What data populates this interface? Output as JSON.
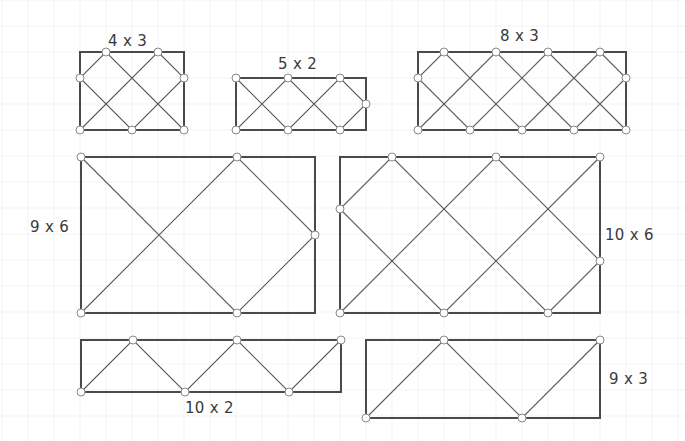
{
  "diagram": {
    "unit_px": 26,
    "colors": {
      "border": "#4a4a4a",
      "diagonal": "#5a5a5a",
      "node_stroke": "#8a8a8a",
      "background": "#ffffff"
    },
    "rectangles": [
      {
        "id": "r4x3",
        "label": "4 x 3",
        "cols": 4,
        "rows": 3,
        "x": 80,
        "y": 52,
        "label_pos": "top",
        "label_x": 108,
        "label_y": 32
      },
      {
        "id": "r5x2",
        "label": "5 x 2",
        "cols": 5,
        "rows": 2,
        "x": 236,
        "y": 78,
        "label_pos": "top",
        "label_x": 278,
        "label_y": 55
      },
      {
        "id": "r8x3",
        "label": "8 x 3",
        "cols": 8,
        "rows": 3,
        "x": 418,
        "y": 52,
        "label_pos": "top",
        "label_x": 500,
        "label_y": 27
      },
      {
        "id": "r9x6",
        "label": "9 x 6",
        "cols": 9,
        "rows": 6,
        "x": 81,
        "y": 157,
        "label_pos": "left",
        "label_x": 30,
        "label_y": 218
      },
      {
        "id": "r10x6",
        "label": "10 x 6",
        "cols": 10,
        "rows": 6,
        "x": 340,
        "y": 157,
        "label_pos": "right",
        "label_x": 605,
        "label_y": 226
      },
      {
        "id": "r10x2",
        "label": "10 x 2",
        "cols": 10,
        "rows": 2,
        "x": 81,
        "y": 340,
        "label_pos": "bottom",
        "label_x": 185,
        "label_y": 399
      },
      {
        "id": "r9x3",
        "label": "9 x 3",
        "cols": 9,
        "rows": 3,
        "x": 366,
        "y": 340,
        "label_pos": "right",
        "label_x": 609,
        "label_y": 370
      }
    ]
  }
}
